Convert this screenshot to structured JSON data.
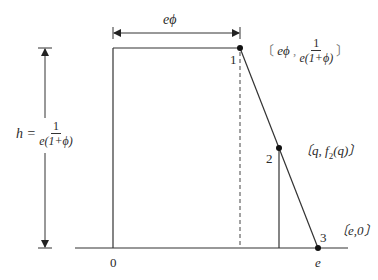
{
  "diagram": {
    "type": "piecewise-linear-function",
    "baseline_tick_labels": {
      "origin": "0",
      "end": "e"
    },
    "width_annotation": {
      "label": "eϕ"
    },
    "height_annotation": {
      "lhs": "h =",
      "numerator": "1",
      "denominator": "e(1+ϕ)"
    },
    "points": [
      {
        "id": "1",
        "coord_open": "〔",
        "coord_x": "eϕ",
        "coord_sep": " ,",
        "coord_y_numerator": "1",
        "coord_y_denominator": "e(1+ϕ)",
        "coord_close": "〕"
      },
      {
        "id": "2",
        "coord_text": "〔q, f",
        "coord_sub": "2",
        "coord_tail": "(q)〕"
      },
      {
        "id": "3",
        "coord_text": "〔e,0〕"
      }
    ],
    "colors": {
      "line": "#333333",
      "point": "#111111",
      "text": "#2a2a2a"
    }
  }
}
